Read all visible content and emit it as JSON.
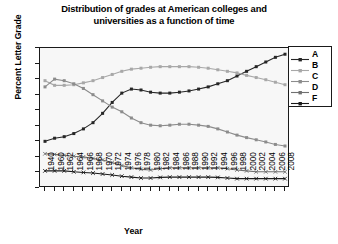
{
  "chart_data": {
    "type": "line",
    "title": "Distribution of grades at American colleges and universities as a function of time",
    "title_line1": "Distribution of grades at American colleges and",
    "title_line2": "universities as a function of time",
    "xlabel": "Year",
    "ylabel": "Percent Letter Grade",
    "ylim": [
      0,
      45
    ],
    "yticks": [
      0,
      5,
      10,
      15,
      20,
      25,
      30,
      35,
      40,
      45
    ],
    "grid": false,
    "legend_position": "right",
    "x": [
      1940,
      1960,
      1962,
      1964,
      1966,
      1968,
      1970,
      1972,
      1974,
      1976,
      1978,
      1980,
      1982,
      1984,
      1986,
      1988,
      1990,
      1992,
      1994,
      1996,
      1998,
      2000,
      2002,
      2004,
      2006,
      2008
    ],
    "categories": [
      "1940",
      "1960",
      "1962",
      "1964",
      "1966",
      "1968",
      "1970",
      "1972",
      "1974",
      "1976",
      "1978",
      "1980",
      "1982",
      "1984",
      "1986",
      "1988",
      "1990",
      "1992",
      "1994",
      "1996",
      "1998",
      "2000",
      "2002",
      "2004",
      "2006",
      "2008"
    ],
    "series": [
      {
        "name": "A",
        "color": "#262626",
        "marker": "square",
        "values": [
          15.0,
          16.0,
          16.5,
          17.5,
          19.0,
          21.0,
          24.0,
          27.5,
          30.5,
          31.8,
          31.5,
          30.8,
          30.5,
          30.5,
          30.8,
          31.2,
          31.8,
          32.5,
          33.5,
          34.5,
          36.0,
          37.5,
          39.0,
          40.5,
          42.0,
          43.0
        ]
      },
      {
        "name": "B",
        "color": "#a8a8a8",
        "marker": "square",
        "values": [
          34.5,
          33.0,
          33.0,
          33.2,
          33.8,
          34.5,
          35.5,
          36.5,
          37.5,
          38.2,
          38.5,
          38.8,
          39.0,
          39.0,
          39.0,
          39.0,
          38.8,
          38.5,
          38.0,
          37.5,
          37.0,
          36.2,
          35.5,
          34.8,
          34.0,
          33.2
        ]
      },
      {
        "name": "C",
        "color": "#8c8c8c",
        "marker": "square",
        "values": [
          32.5,
          35.0,
          34.5,
          33.5,
          32.0,
          30.0,
          28.0,
          26.0,
          24.5,
          22.5,
          21.0,
          20.2,
          20.0,
          20.2,
          20.5,
          20.5,
          20.2,
          19.8,
          19.0,
          18.0,
          17.0,
          16.2,
          15.5,
          14.8,
          14.0,
          13.5
        ]
      },
      {
        "name": "D",
        "color": "#707070",
        "marker": "x",
        "values": [
          11.0,
          10.8,
          10.5,
          10.2,
          10.0,
          9.5,
          9.0,
          8.2,
          7.2,
          6.5,
          6.0,
          5.8,
          6.2,
          6.5,
          6.5,
          6.5,
          6.5,
          6.5,
          6.5,
          6.2,
          5.8,
          5.5,
          5.2,
          5.2,
          5.2,
          5.2
        ]
      },
      {
        "name": "F",
        "color": "#1a1a1a",
        "marker": "x",
        "values": [
          5.5,
          5.5,
          5.5,
          5.2,
          5.0,
          4.8,
          4.5,
          4.2,
          3.8,
          3.5,
          3.2,
          3.2,
          3.4,
          3.5,
          3.5,
          3.5,
          3.5,
          3.5,
          3.4,
          3.2,
          3.0,
          3.0,
          3.0,
          3.0,
          3.0,
          3.0
        ]
      }
    ]
  },
  "legend": {
    "items": [
      {
        "label": "A",
        "color": "#262626"
      },
      {
        "label": "B",
        "color": "#a8a8a8"
      },
      {
        "label": "C",
        "color": "#8c8c8c"
      },
      {
        "label": "D",
        "color": "#707070"
      },
      {
        "label": "F",
        "color": "#1a1a1a"
      }
    ]
  }
}
